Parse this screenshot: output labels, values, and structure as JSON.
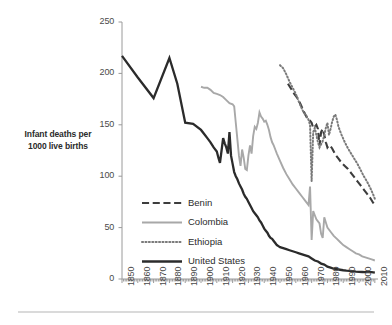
{
  "chart_data": {
    "type": "line",
    "title": "",
    "xlabel": "",
    "ylabel": "Infant deaths per 1000 live births",
    "ylabel_line1": "Infant deaths per",
    "ylabel_line2": "1000 live births",
    "xlim": [
      1850,
      2012
    ],
    "ylim": [
      0,
      250
    ],
    "yticks": [
      0,
      50,
      100,
      150,
      200,
      250
    ],
    "ytick_labels": [
      "0",
      "50",
      "100",
      "150",
      "200",
      "250"
    ],
    "xticks": [
      1850,
      1860,
      1870,
      1880,
      1890,
      1900,
      1910,
      1920,
      1930,
      1940,
      1950,
      1960,
      1970,
      1980,
      1990,
      2000,
      2010
    ],
    "xtick_labels": [
      "1850",
      "1860",
      "1870",
      "1880",
      "1890",
      "1900",
      "1910",
      "1920",
      "1930",
      "1940",
      "1950",
      "1960",
      "1970",
      "1980",
      "1990",
      "2000",
      "2010"
    ],
    "grid": false,
    "legend_position": "center-left",
    "colors": {
      "benin": "#3d3d3d",
      "colombia": "#a8a8a8",
      "ethiopia": "#7a7a7a",
      "united_states": "#2b2b2b",
      "axis": "#9a9a9a",
      "text": "#4a4a4a"
    },
    "series": [
      {
        "name": "Benin",
        "style": "dashed",
        "color": "#3d3d3d",
        "width": 2.1,
        "x": [
          1955,
          1957,
          1959,
          1961,
          1963,
          1965,
          1967,
          1969,
          1970,
          1971,
          1972,
          1973,
          1974,
          1975,
          1976,
          1977,
          1978,
          1979,
          1980,
          1981,
          1982,
          1983,
          1984,
          1985,
          1987,
          1989,
          1991,
          1993,
          1995,
          1997,
          1999,
          2001,
          2003,
          2005,
          2007,
          2009,
          2010
        ],
        "values": [
          190,
          185,
          180,
          176,
          170,
          163,
          157,
          154,
          152,
          147,
          148,
          150,
          146,
          130,
          143,
          146,
          140,
          133,
          128,
          130,
          129,
          127,
          124,
          121,
          117,
          113,
          110,
          107,
          103,
          99,
          95,
          91,
          87,
          83,
          79,
          74,
          72
        ]
      },
      {
        "name": "Colombia",
        "style": "solid",
        "color": "#a8a8a8",
        "width": 1.9,
        "x": [
          1900,
          1902,
          1904,
          1906,
          1908,
          1910,
          1912,
          1914,
          1916,
          1918,
          1920,
          1921,
          1922,
          1923,
          1924,
          1925,
          1926,
          1927,
          1928,
          1929,
          1930,
          1931,
          1932,
          1933,
          1934,
          1935,
          1936,
          1937,
          1938,
          1939,
          1940,
          1941,
          1942,
          1943,
          1944,
          1945,
          1946,
          1947,
          1948,
          1950,
          1952,
          1954,
          1956,
          1958,
          1960,
          1962,
          1964,
          1966,
          1968,
          1969,
          1970,
          1971,
          1972,
          1973,
          1974,
          1975,
          1976,
          1977,
          1978,
          1979,
          1980,
          1982,
          1984,
          1986,
          1988,
          1990,
          1992,
          1994,
          1996,
          1998,
          2000,
          2002,
          2004,
          2006,
          2008,
          2010
        ],
        "values": [
          187,
          186,
          186,
          184,
          181,
          180,
          179,
          177,
          174,
          171,
          170,
          168,
          152,
          136,
          120,
          110,
          126,
          118,
          107,
          106,
          120,
          130,
          122,
          139,
          148,
          146,
          152,
          162,
          158,
          156,
          153,
          154,
          150,
          145,
          138,
          133,
          130,
          126,
          122,
          115,
          108,
          102,
          97,
          92,
          88,
          84,
          80,
          76,
          72,
          90,
          38,
          66,
          62,
          58,
          56,
          54,
          44,
          40,
          60,
          55,
          50,
          46,
          42,
          39,
          36,
          33,
          31,
          29,
          27,
          25,
          24,
          22,
          21,
          20,
          19,
          18
        ]
      },
      {
        "name": "Ethiopia",
        "style": "dotted",
        "color": "#7a7a7a",
        "width": 2.0,
        "x": [
          1950,
          1952,
          1954,
          1956,
          1958,
          1960,
          1962,
          1964,
          1965,
          1966,
          1967,
          1968,
          1969,
          1970,
          1971,
          1972,
          1973,
          1974,
          1975,
          1976,
          1977,
          1978,
          1979,
          1980,
          1981,
          1982,
          1983,
          1984,
          1985,
          1986,
          1987,
          1989,
          1991,
          1993,
          1995,
          1997,
          1999,
          2001,
          2003,
          2005,
          2007,
          2009,
          2010
        ],
        "values": [
          208,
          205,
          199,
          192,
          186,
          180,
          172,
          165,
          162,
          160,
          158,
          155,
          150,
          95,
          143,
          147,
          140,
          133,
          128,
          131,
          134,
          140,
          147,
          152,
          140,
          146,
          153,
          158,
          160,
          155,
          148,
          140,
          133,
          127,
          122,
          117,
          112,
          106,
          100,
          95,
          89,
          82,
          78
        ]
      },
      {
        "name": "United States",
        "style": "solid",
        "color": "#2b2b2b",
        "width": 2.3,
        "x": [
          1850,
          1860,
          1870,
          1880,
          1885,
          1890,
          1895,
          1900,
          1902,
          1904,
          1906,
          1908,
          1910,
          1911,
          1912,
          1913,
          1914,
          1915,
          1916,
          1917,
          1918,
          1919,
          1920,
          1921,
          1922,
          1923,
          1924,
          1925,
          1926,
          1927,
          1928,
          1929,
          1930,
          1931,
          1932,
          1933,
          1934,
          1935,
          1936,
          1937,
          1938,
          1939,
          1940,
          1941,
          1942,
          1943,
          1944,
          1945,
          1946,
          1947,
          1948,
          1949,
          1950,
          1952,
          1954,
          1956,
          1958,
          1960,
          1962,
          1964,
          1966,
          1968,
          1970,
          1972,
          1974,
          1976,
          1978,
          1980,
          1982,
          1984,
          1986,
          1988,
          1990,
          1992,
          1994,
          1996,
          1998,
          2000,
          2002,
          2004,
          2006,
          2008,
          2010
        ],
        "values": [
          217,
          196,
          176,
          215,
          190,
          152,
          151,
          145,
          141,
          137,
          133,
          128,
          124,
          118,
          113,
          125,
          137,
          132,
          128,
          122,
          143,
          120,
          112,
          104,
          100,
          97,
          93,
          90,
          87,
          83,
          80,
          78,
          75,
          72,
          69,
          66,
          64,
          62,
          60,
          57,
          55,
          52,
          49,
          47,
          45,
          42,
          40,
          39,
          37,
          35,
          33,
          32,
          31,
          30,
          29,
          28,
          27,
          26,
          25,
          24,
          23,
          22,
          20,
          18,
          17,
          15,
          14,
          12,
          11,
          10,
          9.5,
          9,
          8.5,
          8.2,
          8,
          7.6,
          7.2,
          6.9,
          6.8,
          6.7,
          6.7,
          6.6,
          6.1
        ]
      }
    ]
  },
  "legend": {
    "items": [
      {
        "label": "Benin"
      },
      {
        "label": "Colombia"
      },
      {
        "label": "Ethiopia"
      },
      {
        "label": "United States"
      }
    ]
  }
}
